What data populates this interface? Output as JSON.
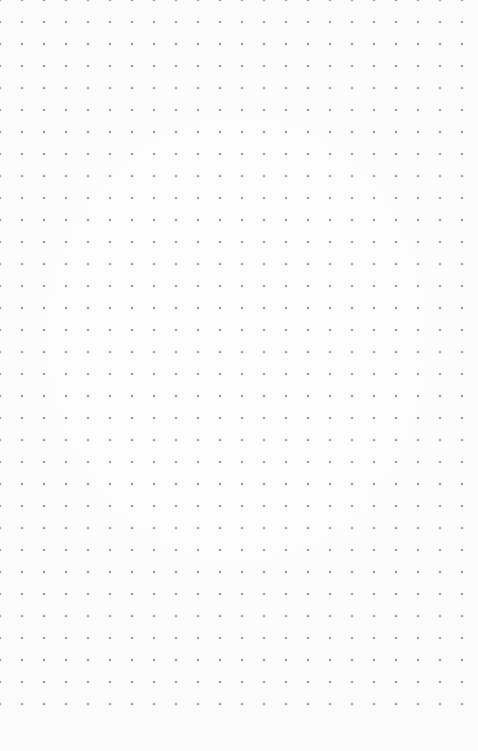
{
  "page": {
    "kind": "dot-grid-page",
    "width": 478,
    "height": 751,
    "background_color": "#fefefe",
    "text_content": ""
  },
  "grid": {
    "dot_color": "#8a8a92",
    "dot_size": 2,
    "spacing": 22,
    "origin_x": 22,
    "origin_y": 22,
    "columns": 21,
    "rows": 32,
    "first_dot_x": 22,
    "first_dot_y": 22,
    "last_dot_x": 462,
    "last_dot_y": 704,
    "margin_left": 22,
    "margin_top": 22,
    "margin_right": 16,
    "margin_bottom": 47
  }
}
